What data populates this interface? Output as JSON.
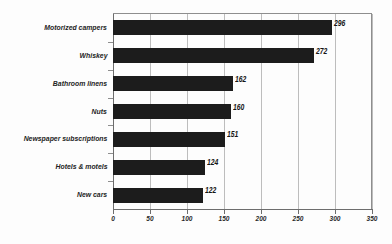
{
  "chart_data": {
    "type": "bar",
    "orientation": "horizontal",
    "title": "",
    "subtitle": "",
    "xlabel": "",
    "ylabel": "",
    "xlim": [
      0,
      350
    ],
    "ylim": null,
    "grid": true,
    "legend": null,
    "legend_position": "none",
    "xticks": [
      0,
      50,
      100,
      150,
      200,
      250,
      300,
      350
    ],
    "xticklabels": [
      "0",
      "50",
      "100",
      "150",
      "200",
      "250",
      "300",
      "350"
    ],
    "categories": [
      "Motorized campers",
      "Whiskey",
      "Bathroom linens",
      "Nuts",
      "Newspaper subscriptions",
      "Hotels & motels",
      "New cars"
    ],
    "values": [
      296,
      272,
      162,
      160,
      151,
      124,
      122
    ],
    "value_labels": [
      "296",
      "272",
      "162",
      "160",
      "151",
      "124",
      "122"
    ],
    "bar_color": "#1c1c1c",
    "series": [
      {
        "name": "",
        "values": [
          296,
          272,
          162,
          160,
          151,
          124,
          122
        ]
      }
    ]
  },
  "style": {
    "background": "#fdfdfd",
    "axis_color": "#6d6d6d",
    "grid_color": "#9a9a9a",
    "frame_color": "#8e8e8e",
    "text_color": "#242424"
  }
}
